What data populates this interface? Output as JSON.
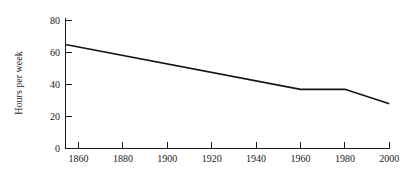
{
  "chart_data": {
    "type": "line",
    "title": "",
    "xlabel": "",
    "ylabel": "Hours per week",
    "xlim": [
      1854,
      2000
    ],
    "ylim": [
      0,
      85
    ],
    "grid": false,
    "legend": false,
    "x_ticks": [
      1860,
      1880,
      1900,
      1920,
      1940,
      1960,
      1980,
      2000
    ],
    "x_tick_labels": [
      "1860",
      "1880",
      "1900",
      "1920",
      "1940",
      "1960",
      "1980",
      "2000"
    ],
    "y_ticks": [
      0,
      20,
      40,
      60,
      80
    ],
    "y_tick_labels": [
      "0",
      "20",
      "40",
      "60",
      "80"
    ],
    "series": [
      {
        "name": "Hours per week",
        "color": "#141414",
        "x": [
          1854,
          1960,
          1980,
          2000
        ],
        "values": [
          65,
          37,
          37,
          28
        ]
      }
    ]
  },
  "axis": {
    "y_title": "Hours per week"
  }
}
